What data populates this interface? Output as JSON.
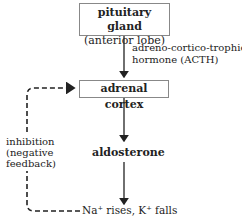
{
  "diagram": {
    "nodes": {
      "pituitary": {
        "title": "pituitary gland",
        "subtitle": "(anterior lobe)"
      },
      "adrenal": {
        "title": "adrenal cortex"
      },
      "aldosterone": {
        "title": "aldosterone"
      },
      "effect": {
        "text": "Na⁺ rises, K⁺ falls"
      }
    },
    "edges": {
      "acth_label_line1": "adreno-cortico-trophic",
      "acth_label_line2": "hormone (ACTH)",
      "feedback_line1": "inhibition",
      "feedback_line2": "(negative",
      "feedback_line3": "feedback)"
    },
    "colors": {
      "line": "#222222",
      "box_border": "#888888"
    }
  }
}
